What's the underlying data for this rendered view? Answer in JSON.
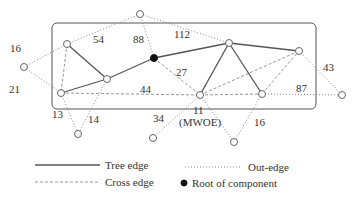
{
  "diagram": {
    "type": "graph-component",
    "component_box": {
      "x": 52,
      "y": 23,
      "w": 264,
      "h": 86,
      "r": 5
    },
    "nodes": [
      {
        "id": "out_top",
        "x": 140,
        "y": 14,
        "kind": "external"
      },
      {
        "id": "out_left",
        "x": 24,
        "y": 67,
        "kind": "external"
      },
      {
        "id": "A",
        "x": 67,
        "y": 44,
        "kind": "internal"
      },
      {
        "id": "B",
        "x": 61,
        "y": 93,
        "kind": "internal"
      },
      {
        "id": "C",
        "x": 107,
        "y": 79,
        "kind": "internal"
      },
      {
        "id": "root",
        "x": 154,
        "y": 58,
        "kind": "root"
      },
      {
        "id": "D",
        "x": 229,
        "y": 43,
        "kind": "internal"
      },
      {
        "id": "E",
        "x": 200,
        "y": 95,
        "kind": "internal"
      },
      {
        "id": "F",
        "x": 262,
        "y": 94,
        "kind": "internal"
      },
      {
        "id": "G",
        "x": 299,
        "y": 51,
        "kind": "internal"
      },
      {
        "id": "out_right",
        "x": 342,
        "y": 95,
        "kind": "external"
      },
      {
        "id": "out_b1",
        "x": 78,
        "y": 134,
        "kind": "external"
      },
      {
        "id": "out_b2",
        "x": 153,
        "y": 138,
        "kind": "external"
      },
      {
        "id": "out_b3",
        "x": 234,
        "y": 142,
        "kind": "external"
      }
    ],
    "tree_edges": [
      [
        "A",
        "C"
      ],
      [
        "B",
        "C"
      ],
      [
        "C",
        "root"
      ],
      [
        "root",
        "D"
      ],
      [
        "D",
        "G"
      ],
      [
        "D",
        "E"
      ],
      [
        "D",
        "F"
      ]
    ],
    "cross_edges": [
      [
        "A",
        "B"
      ],
      [
        "root",
        "E"
      ],
      [
        "B",
        "E"
      ],
      [
        "E",
        "F"
      ],
      [
        "E",
        "G"
      ],
      [
        "F",
        "G"
      ]
    ],
    "out_edges": [
      [
        "A",
        "out_top"
      ],
      [
        "out_top",
        "D"
      ],
      [
        "root",
        "out_top"
      ],
      [
        "A",
        "out_left"
      ],
      [
        "out_left",
        "B"
      ],
      [
        "B",
        "out_b1"
      ],
      [
        "C",
        "out_b1"
      ],
      [
        "E",
        "out_b2"
      ],
      [
        "E",
        "out_b3"
      ],
      [
        "F",
        "out_b3"
      ],
      [
        "G",
        "out_right"
      ],
      [
        "F",
        "out_right"
      ]
    ],
    "edge_labels": [
      {
        "text": "16",
        "x": 10,
        "y": 52
      },
      {
        "text": "54",
        "x": 93,
        "y": 43
      },
      {
        "text": "88",
        "x": 133,
        "y": 43
      },
      {
        "text": "112",
        "x": 174,
        "y": 38
      },
      {
        "text": "21",
        "x": 9,
        "y": 93
      },
      {
        "text": "27",
        "x": 176,
        "y": 76
      },
      {
        "text": "44",
        "x": 140,
        "y": 93
      },
      {
        "text": "87",
        "x": 296,
        "y": 92
      },
      {
        "text": "43",
        "x": 323,
        "y": 71
      },
      {
        "text": "13",
        "x": 52,
        "y": 118
      },
      {
        "text": "14",
        "x": 88,
        "y": 123
      },
      {
        "text": "34",
        "x": 153,
        "y": 122
      },
      {
        "text": "11",
        "x": 193,
        "y": 114
      },
      {
        "text": "(MWOE)",
        "x": 179,
        "y": 126
      },
      {
        "text": "16",
        "x": 254,
        "y": 126
      }
    ]
  },
  "legend": {
    "tree_edge": "Tree edge",
    "cross_edge": "Cross edge",
    "out_edge": "Out-edge",
    "root": "Root of component"
  }
}
